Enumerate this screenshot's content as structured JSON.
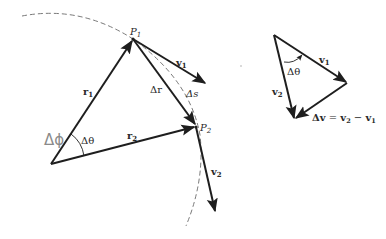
{
  "diagram": {
    "colors": {
      "stroke": "#1e1e1e",
      "dashed": "#6a6a6a",
      "handwriting": "#8a8a8a",
      "background": "#ffffff"
    },
    "points": {
      "P1": {
        "label": "P",
        "sub": "1"
      },
      "P2": {
        "label": "P",
        "sub": "2"
      }
    },
    "labels": {
      "r1": {
        "main": "r",
        "sub": "1"
      },
      "r2": {
        "main": "r",
        "sub": "2"
      },
      "delta_r": "Δr",
      "delta_s": "Δs",
      "v1": {
        "main": "v",
        "sub": "1"
      },
      "v2": {
        "main": "v",
        "sub": "2"
      },
      "delta_theta_left": "Δθ",
      "handwritten_delta_phi": "Δϕ"
    },
    "vector_triangle": {
      "v1": {
        "main": "v",
        "sub": "1"
      },
      "v2": {
        "main": "v",
        "sub": "2"
      },
      "delta_theta": "Δθ",
      "equation": "Δv = v₂ − v₁",
      "equation_parts": {
        "lhs": "Δv",
        "eq": " = ",
        "a": "v",
        "a_sub": "2",
        "minus": " − ",
        "b": "v",
        "b_sub": "1"
      }
    }
  }
}
